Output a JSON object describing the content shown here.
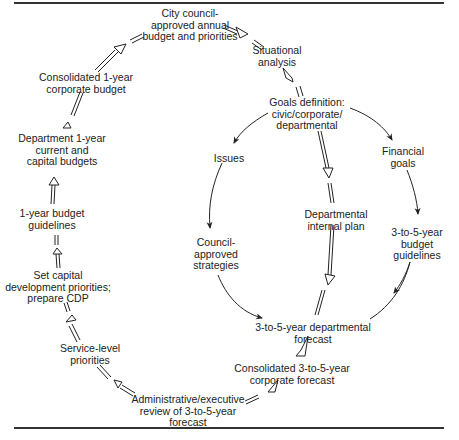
{
  "diagram": {
    "type": "flowchart-cycle",
    "nodes": [
      {
        "id": "city",
        "lines": [
          "City council-",
          "approved annual",
          "budget and priorities"
        ],
        "x": 190,
        "y": 13
      },
      {
        "id": "situational",
        "lines": [
          "Situational",
          "analysis"
        ],
        "x": 277,
        "y": 50
      },
      {
        "id": "goals",
        "lines": [
          "Goals definition:",
          "civic/corporate/",
          "departmental"
        ],
        "x": 308,
        "y": 100
      },
      {
        "id": "issues",
        "lines": [
          "Issues"
        ],
        "x": 229,
        "y": 151
      },
      {
        "id": "financial",
        "lines": [
          "Financial",
          "goals"
        ],
        "x": 403,
        "y": 151
      },
      {
        "id": "dept-internal",
        "lines": [
          "Departmental",
          "internal plan"
        ],
        "x": 336,
        "y": 210
      },
      {
        "id": "budget-35",
        "lines": [
          "3-to-5-year",
          "budget",
          "guidelines"
        ],
        "x": 417,
        "y": 229
      },
      {
        "id": "council-strat",
        "lines": [
          "Council-",
          "approved",
          "strategies"
        ],
        "x": 216,
        "y": 238
      },
      {
        "id": "dept-forecast",
        "lines": [
          "3-to-5-year departmental",
          "forecast"
        ],
        "x": 313,
        "y": 322
      },
      {
        "id": "corp-forecast",
        "lines": [
          "Consolidated 3-to-5-year",
          "corporate forecast"
        ],
        "x": 292,
        "y": 365
      },
      {
        "id": "admin-review",
        "lines": [
          "Administrative/executive",
          "review of 3-to-5-year",
          "forecast"
        ],
        "x": 188,
        "y": 396
      },
      {
        "id": "service-level",
        "lines": [
          "Service-level",
          "priorities"
        ],
        "x": 90,
        "y": 345
      },
      {
        "id": "capital-dev",
        "lines": [
          "Set capital",
          "development priorities;",
          "prepare CDP"
        ],
        "x": 62,
        "y": 275
      },
      {
        "id": "budget-1y",
        "lines": [
          "1-year budget",
          "guidelines"
        ],
        "x": 55,
        "y": 209
      },
      {
        "id": "dept-1y",
        "lines": [
          "Department 1-year",
          "current and",
          "capital budgets"
        ],
        "x": 62,
        "y": 136
      },
      {
        "id": "consol-1y",
        "lines": [
          "Consolidated 1-year",
          "corporate budget"
        ],
        "x": 86,
        "y": 73
      }
    ],
    "edges": [
      {
        "from": "city",
        "to": "situational",
        "style": "double-hollow"
      },
      {
        "from": "situational",
        "to": "goals",
        "style": "double-hollow"
      },
      {
        "from": "goals",
        "to": "issues",
        "style": "single"
      },
      {
        "from": "goals",
        "to": "financial",
        "style": "single"
      },
      {
        "from": "goals",
        "to": "dept-internal",
        "style": "double-hollow"
      },
      {
        "from": "issues",
        "to": "council-strat",
        "style": "single"
      },
      {
        "from": "financial",
        "to": "budget-35",
        "style": "single"
      },
      {
        "from": "council-strat",
        "to": "dept-forecast",
        "style": "single"
      },
      {
        "from": "budget-35",
        "to": "dept-forecast",
        "style": "single"
      },
      {
        "from": "dept-internal",
        "to": "dept-forecast",
        "style": "double-hollow"
      },
      {
        "from": "dept-forecast",
        "to": "corp-forecast",
        "style": "double-hollow"
      },
      {
        "from": "corp-forecast",
        "to": "admin-review",
        "style": "double-hollow"
      },
      {
        "from": "admin-review",
        "to": "service-level",
        "style": "double-hollow"
      },
      {
        "from": "service-level",
        "to": "capital-dev",
        "style": "double-hollow"
      },
      {
        "from": "capital-dev",
        "to": "budget-1y",
        "style": "double-hollow"
      },
      {
        "from": "budget-1y",
        "to": "dept-1y",
        "style": "double-hollow"
      },
      {
        "from": "dept-1y",
        "to": "consol-1y",
        "style": "double-hollow"
      },
      {
        "from": "consol-1y",
        "to": "city",
        "style": "double-hollow"
      }
    ]
  },
  "labels": {
    "city": "City council-\napproved annual\nbudget and priorities"
  }
}
